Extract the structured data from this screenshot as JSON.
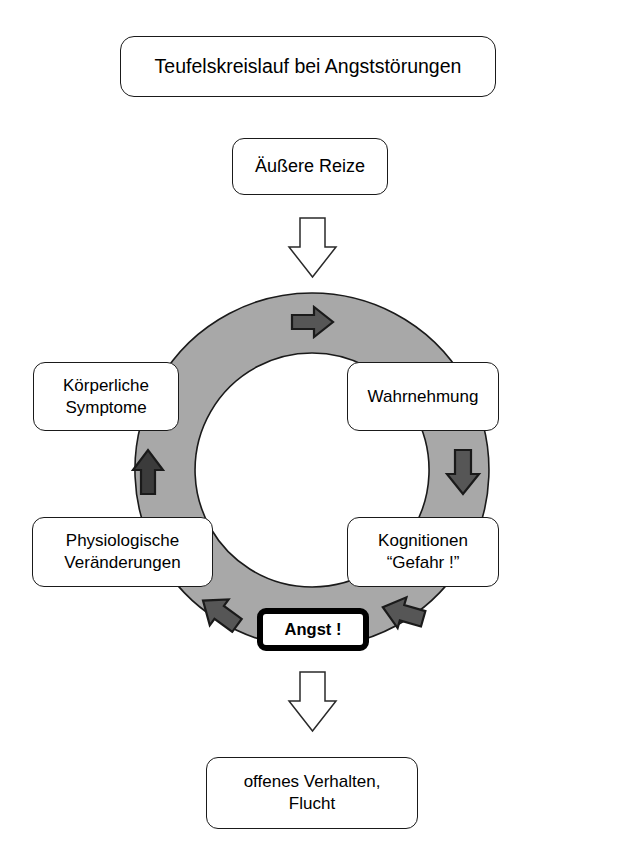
{
  "diagram": {
    "title": "Teufelskreislauf bei Angststörungen",
    "stimuli": "Äußere Reize",
    "outcome_line1": "offenes Verhalten,",
    "outcome_line2": "Flucht",
    "center_label": "Angst !",
    "nodes": [
      {
        "id": "wahrnehmung",
        "label": "Wahrnehmung",
        "line1": "Wahrnehmung",
        "line2": ""
      },
      {
        "id": "kognitionen",
        "label": "Kognitionen \"Gefahr !\"",
        "line1": "Kognitionen",
        "line2": "“Gefahr !”"
      },
      {
        "id": "physiologische",
        "label": "Physiologische Veränderungen",
        "line1": "Physiologische",
        "line2": "Veränderungen"
      },
      {
        "id": "koerperliche",
        "label": "Körperliche Symptome",
        "line1": "Körperliche",
        "line2": "Symptome"
      }
    ],
    "flow_arrows": [
      {
        "id": "arrow-top",
        "direction": "right",
        "position": "top-of-ring"
      },
      {
        "id": "arrow-right",
        "direction": "down",
        "position": "right-of-ring"
      },
      {
        "id": "arrow-bottom-right",
        "direction": "left",
        "position": "bottom-right-of-ring"
      },
      {
        "id": "arrow-bottom-left",
        "direction": "upper-left",
        "position": "bottom-left-of-ring"
      },
      {
        "id": "arrow-left",
        "direction": "up",
        "position": "left-of-ring"
      }
    ],
    "entry_arrow": {
      "id": "arrow-entry",
      "direction": "down",
      "style": "hollow-outline"
    },
    "exit_arrow": {
      "id": "arrow-exit",
      "direction": "down",
      "style": "hollow-outline"
    },
    "colors": {
      "ring_fill": "#a8a8a8",
      "ring_stroke": "#1a1a1a",
      "arrow_fill": "#555555",
      "arrow_stroke": "#1a1a1a",
      "box_border": "#1a1a1a",
      "box_fill": "#ffffff",
      "text": "#000000",
      "angst_border": "#000000",
      "page_background": "#ffffff"
    }
  }
}
